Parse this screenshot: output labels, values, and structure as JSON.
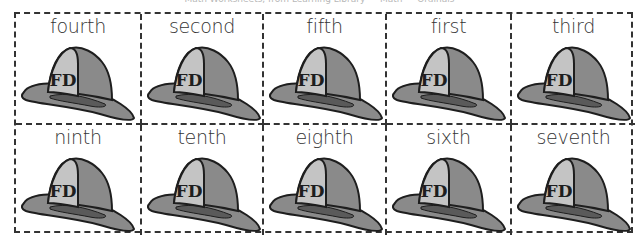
{
  "header": {
    "text": "Math Worksheets, from Learning Library — Math — Ordinals"
  },
  "worksheet": {
    "helmet_text": "FD",
    "colors": {
      "helmet_body": "#8a8a8a",
      "helmet_shield": "#c4c4c4",
      "brim_inner": "#5a5a5a",
      "outline": "#1e1e1e",
      "border": "#333333"
    },
    "cells": [
      {
        "label": "fourth"
      },
      {
        "label": "second"
      },
      {
        "label": "fifth"
      },
      {
        "label": "first"
      },
      {
        "label": "third"
      },
      {
        "label": "ninth"
      },
      {
        "label": "tenth"
      },
      {
        "label": "eighth"
      },
      {
        "label": "sixth"
      },
      {
        "label": "seventh"
      }
    ]
  }
}
